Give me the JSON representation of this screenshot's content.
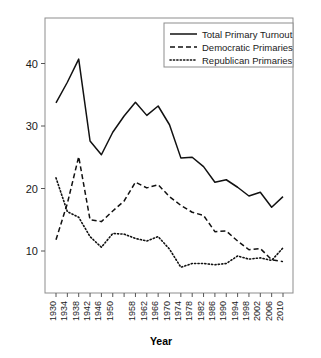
{
  "chart_data": {
    "type": "line",
    "title": "",
    "xlabel": "Year",
    "ylabel": "",
    "grid": false,
    "legend_position": "top-right",
    "xlim": [
      1930,
      2010
    ],
    "ylim": [
      5.5,
      43.5
    ],
    "yticks": [
      10,
      20,
      30,
      40
    ],
    "ytick_labels": [
      "10",
      "20",
      "30",
      "40"
    ],
    "x": [
      1930,
      1934,
      1938,
      1942,
      1946,
      1950,
      1954,
      1958,
      1962,
      1966,
      1970,
      1974,
      1978,
      1982,
      1986,
      1990,
      1994,
      1998,
      2002,
      2006,
      2010
    ],
    "xtick_labels": [
      "1930",
      "1934",
      "1938",
      "1942",
      "1946",
      "1950",
      "",
      "1958",
      "1962",
      "1966",
      "1970",
      "1974",
      "1978",
      "1982",
      "1986",
      "1990",
      "1994",
      "1998",
      "2002",
      "2006",
      "2010"
    ],
    "xtick_labels_all": [
      "1930",
      "1934",
      "1938",
      "1942",
      "1946",
      "1950",
      "1954",
      "1958",
      "1962",
      "1966",
      "1970",
      "1974",
      "1978",
      "1982",
      "1986",
      "1990",
      "1994",
      "1998",
      "2002",
      "2006",
      "2010"
    ],
    "series": [
      {
        "name": "Total Primary Turnout",
        "style": "solid",
        "color": "#111111",
        "values": [
          33.7,
          37.0,
          40.7,
          27.6,
          25.4,
          29.0,
          31.6,
          33.8,
          31.7,
          33.2,
          30.2,
          24.9,
          25.0,
          23.5,
          21.0,
          21.4,
          20.2,
          18.8,
          19.4,
          17.0,
          18.7
        ]
      },
      {
        "name": "Democratic Primaries",
        "style": "dashed",
        "color": "#111111",
        "values": [
          11.8,
          17.6,
          25.1,
          15.0,
          14.7,
          16.4,
          18.0,
          21.0,
          20.1,
          20.6,
          18.7,
          17.3,
          16.2,
          15.7,
          13.1,
          13.2,
          11.6,
          10.2,
          10.4,
          8.6,
          8.3
        ]
      },
      {
        "name": "Republican Primaries",
        "style": "dotted",
        "color": "#111111",
        "values": [
          21.7,
          16.3,
          15.4,
          12.3,
          10.6,
          12.8,
          12.7,
          12.0,
          11.6,
          12.3,
          10.3,
          7.4,
          8.0,
          8.0,
          7.8,
          8.0,
          9.2,
          8.7,
          8.9,
          8.5,
          10.5
        ]
      }
    ]
  },
  "legend": {
    "items": [
      {
        "label": "Total Primary Turnout",
        "style": "solid"
      },
      {
        "label": "Democratic Primaries",
        "style": "dashed"
      },
      {
        "label": "Republican Primaries",
        "style": "dotted"
      }
    ]
  },
  "axes": {
    "x_title": "Year"
  }
}
